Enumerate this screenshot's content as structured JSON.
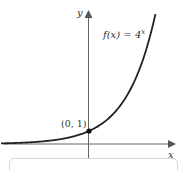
{
  "chart_data": {
    "type": "line",
    "title": "",
    "function_label": "f(x) = 4^x",
    "function_label_base": "f(x) = 4",
    "function_label_exp": "x",
    "xlabel": "x",
    "ylabel": "y",
    "highlighted_point": {
      "x": 0,
      "y": 1,
      "label": "(0, 1)"
    },
    "series": [
      {
        "name": "f(x) = 4^x",
        "x": [
          -2.2,
          -2,
          -1.5,
          -1,
          -0.5,
          0,
          0.5,
          1,
          1.5,
          1.66
        ],
        "values": [
          0.047,
          0.0625,
          0.125,
          0.25,
          0.5,
          1,
          2,
          4,
          8,
          10
        ]
      }
    ],
    "grid": false,
    "xlim": [
      -2.2,
      2.1
    ],
    "ylim": [
      -1.5,
      10.5
    ]
  },
  "colors": {
    "curve": "#222222",
    "axis": "#555555",
    "point": "#111111"
  }
}
